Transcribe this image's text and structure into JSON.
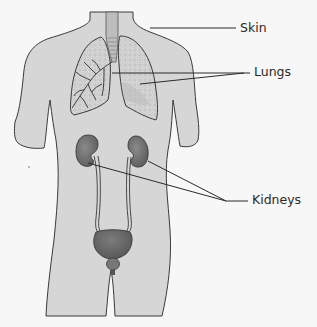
{
  "diagram": {
    "type": "anatomy-labeled-figure",
    "colors": {
      "background": "#f7f7f7",
      "body_fill": "#d6d6d6",
      "outline": "#3a3a3a",
      "lung_fill": "#c4c4c4",
      "organ_fill": "#7a7a7a",
      "leader_line": "#2a2a2a"
    },
    "labels": [
      {
        "id": "skin",
        "text": "Skin",
        "x": 240,
        "y": 22
      },
      {
        "id": "lungs",
        "text": "Lungs",
        "x": 255,
        "y": 66
      },
      {
        "id": "kidneys",
        "text": "Kidneys",
        "x": 253,
        "y": 194
      }
    ]
  }
}
